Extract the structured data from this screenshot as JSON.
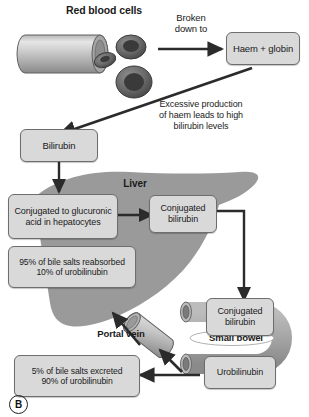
{
  "figure": {
    "panel_label": "B",
    "title_label": "Red blood cells",
    "liver_label": "Liver",
    "small_bowel_label": "Small bowel",
    "portal_vein_label": "Portal vein"
  },
  "colors": {
    "box_fill": "#d9d9d9",
    "box_border": "#6d6d6d",
    "organ_gray": "#9a9a9a",
    "arrow": "#2b2b2b",
    "text": "#1a1a1a",
    "vessel_light": "#cfcfcf",
    "vessel_dark": "#6f6f6f",
    "cell_dark": "#4d4d4d",
    "page_background": "#ffffff"
  },
  "boxes": [
    {
      "id": "haem-globin",
      "text": "Haem + globin"
    },
    {
      "id": "bilirubin",
      "text": "Bilirubin"
    },
    {
      "id": "conjugation",
      "text": "Conjugated to glucuronic\nacid in hepatocytes"
    },
    {
      "id": "conj-bili-liver",
      "text": "Conjugated\nbilirubin"
    },
    {
      "id": "reabsorbed",
      "text": "95% of bile salts reabsorbed\n10% of urobilinubin"
    },
    {
      "id": "conj-bili-bowel",
      "text": "Conjugated\nbilirubin"
    },
    {
      "id": "urobilinubin",
      "text": "Urobilinubin"
    },
    {
      "id": "excreted",
      "text": "5% of bile salts excreted\n90% of urobilinubin"
    }
  ],
  "annotations": [
    {
      "id": "broken-down-to",
      "text": "Broken\ndown to"
    },
    {
      "id": "excessive-production",
      "text": "Excessive production\nof haem leads to high\nbilirubin levels"
    }
  ]
}
